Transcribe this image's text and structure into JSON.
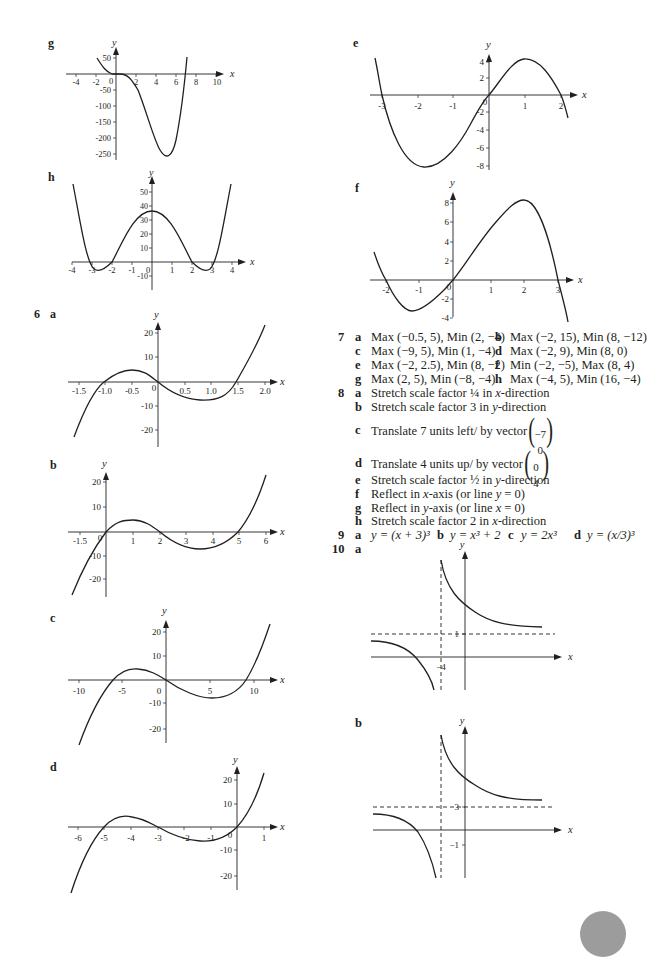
{
  "page": {
    "page_marker_color": "#9c9c9c",
    "text_color": "#231f20"
  },
  "left_column": {
    "graph_g": {
      "label": "g",
      "xlabel": "x",
      "ylabel": "y",
      "xticks": [
        "-4",
        "-2",
        "0",
        "2",
        "4",
        "6",
        "8",
        "10"
      ],
      "yticks": [
        "50",
        "-50",
        "-100",
        "-150",
        "-200",
        "-250"
      ]
    },
    "graph_h": {
      "label": "h",
      "xlabel": "x",
      "ylabel": "y",
      "xticks": [
        "-4",
        "-3",
        "-2",
        "-1",
        "0",
        "1",
        "2",
        "3",
        "4"
      ],
      "yticks": [
        "50",
        "40",
        "30",
        "20",
        "10",
        "-10"
      ]
    },
    "q6": {
      "number": "6",
      "a": {
        "label": "a",
        "xlabel": "x",
        "ylabel": "y",
        "xticks": [
          "-1.5",
          "-1.0",
          "-0.5",
          "0",
          "0.5",
          "1.0",
          "1.5",
          "2.0"
        ],
        "yticks": [
          "20",
          "10",
          "-10",
          "-20"
        ]
      },
      "b": {
        "label": "b",
        "xlabel": "x",
        "ylabel": "y",
        "xticks": [
          "-1.5",
          "0",
          "1",
          "2",
          "3",
          "4",
          "5",
          "6"
        ],
        "yticks": [
          "20",
          "10",
          "-10",
          "-20"
        ]
      },
      "c": {
        "label": "c",
        "xlabel": "x",
        "ylabel": "y",
        "xticks": [
          "-10",
          "-5",
          "0",
          "5",
          "10"
        ],
        "yticks": [
          "20",
          "10",
          "-10",
          "-20"
        ]
      },
      "d": {
        "label": "d",
        "xlabel": "x",
        "ylabel": "y",
        "xticks": [
          "-6",
          "-5",
          "-4",
          "-3",
          "-2",
          "-1",
          "0",
          "1"
        ],
        "yticks": [
          "20",
          "10",
          "-10",
          "-20"
        ]
      }
    }
  },
  "right_column": {
    "graph_e": {
      "label": "e",
      "xlabel": "x",
      "ylabel": "y",
      "xticks": [
        "-3",
        "-2",
        "-1",
        "0",
        "1",
        "2"
      ],
      "yticks": [
        "4",
        "2",
        "-2",
        "-4",
        "-6",
        "-8"
      ]
    },
    "graph_f": {
      "label": "f",
      "xlabel": "x",
      "ylabel": "y",
      "xticks": [
        "-2",
        "-1",
        "0",
        "1",
        "2",
        "3"
      ],
      "yticks": [
        "8",
        "6",
        "4",
        "2",
        "-2",
        "-4"
      ]
    },
    "q7": {
      "number": "7",
      "items": [
        {
          "label": "a",
          "text": "Max (−0.5, 5), Min (2, −4)"
        },
        {
          "label": "b",
          "text": "Max (−2, 15), Min (8, −12)"
        },
        {
          "label": "c",
          "text": "Max (−9, 5), Min (1, −4)"
        },
        {
          "label": "d",
          "text": "Max (−2, 9), Min (8, 0)"
        },
        {
          "label": "e",
          "text": "Max (−2, 2.5), Min (8, −2)"
        },
        {
          "label": "f",
          "text": "Min (−2, −5), Max (8, 4)"
        },
        {
          "label": "g",
          "text": "Max (2, 5), Min (−8, −4)"
        },
        {
          "label": "h",
          "text": "Max (−4, 5), Min (16, −4)"
        }
      ]
    },
    "q8": {
      "number": "8",
      "items": [
        {
          "label": "a",
          "pre": "Stretch scale factor ¼ in ",
          "var": "x",
          "post": "-direction"
        },
        {
          "label": "b",
          "pre": "Stretch scale factor 3 in ",
          "var": "y",
          "post": "-direction"
        },
        {
          "label": "c",
          "pre": "Translate 7 units left/ by vector",
          "vec_top": "−7",
          "vec_bot": "0"
        },
        {
          "label": "d",
          "pre": "Translate 4 units up/ by vector",
          "vec_top": "0",
          "vec_bot": "4"
        },
        {
          "label": "e",
          "pre": "Stretch scale factor ½ in ",
          "var": "y",
          "post": "-direction"
        },
        {
          "label": "f",
          "pre": "Reflect in ",
          "var": "x",
          "post": "-axis (or line ",
          "var2": "y",
          "post2": " = 0)"
        },
        {
          "label": "g",
          "pre": "Reflect in ",
          "var": "y",
          "post": "-axis (or line ",
          "var2": "x",
          "post2": " = 0)"
        },
        {
          "label": "h",
          "pre": "Stretch scale factor 2 in ",
          "var": "x",
          "post": "-direction"
        }
      ]
    },
    "q9": {
      "number": "9",
      "items": [
        {
          "label": "a",
          "text": "y = (x + 3)³"
        },
        {
          "label": "b",
          "text": "y = x³ + 2"
        },
        {
          "label": "c",
          "text": "y = 2x³"
        },
        {
          "label": "d",
          "text": "y = (x/3)³"
        }
      ]
    },
    "q10": {
      "number": "10",
      "a": {
        "label": "a",
        "xlabel": "x",
        "ylabel": "y",
        "asymptote_y_label": "1",
        "asymptote_x_label": "−4"
      },
      "b": {
        "label": "b",
        "xlabel": "x",
        "ylabel": "y",
        "asymptote_y_label": "3",
        "tick_label": "−1"
      }
    }
  }
}
